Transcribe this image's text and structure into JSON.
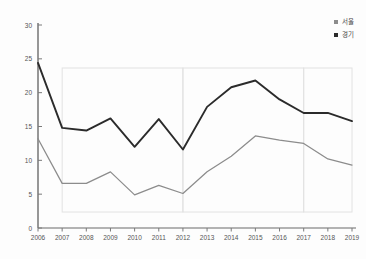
{
  "title_remnant": "",
  "legend": {
    "position": "top-right",
    "entries": [
      {
        "label": "서울",
        "color": "#8c8c8c",
        "marker": "square-marker"
      },
      {
        "label": "경기",
        "color": "#2b2b2b",
        "marker": "square-marker"
      }
    ]
  },
  "axis": {
    "y_ticks": [
      "0",
      "5",
      "10",
      "15",
      "20",
      "25",
      "30"
    ],
    "x_ticks": [
      "2006",
      "2007",
      "2008",
      "2009",
      "2010",
      "2011",
      "2012",
      "2013",
      "2014",
      "2015",
      "2016",
      "2017",
      "2018",
      "2019"
    ]
  },
  "chart_data": {
    "type": "line",
    "title": "",
    "xlabel": "",
    "ylabel": "",
    "x": [
      2006,
      2007,
      2008,
      2009,
      2010,
      2011,
      2012,
      2013,
      2014,
      2015,
      2016,
      2017,
      2018,
      2019
    ],
    "categories": [
      "2006",
      "2007",
      "2008",
      "2009",
      "2010",
      "2011",
      "2012",
      "2013",
      "2014",
      "2015",
      "2016",
      "2017",
      "2018",
      "2019"
    ],
    "series": [
      {
        "name": "서울",
        "color": "#2b2b2b",
        "values": [
          24.4,
          14.8,
          14.4,
          16.2,
          12.0,
          16.1,
          11.6,
          17.9,
          20.8,
          21.8,
          19.0,
          17.0,
          17.0,
          15.8
        ]
      },
      {
        "name": "경기",
        "color": "#8c8c8c",
        "values": [
          13.2,
          6.6,
          6.6,
          8.3,
          4.9,
          6.3,
          5.1,
          8.3,
          10.6,
          13.6,
          13.0,
          12.5,
          10.2,
          9.3
        ]
      }
    ],
    "ylim": [
      0,
      30
    ],
    "xlim": [
      2006,
      2019
    ],
    "grid": false,
    "highlight_bands": [
      {
        "from": "2007",
        "to": "2012"
      },
      {
        "from": "2012",
        "to": "2017"
      },
      {
        "from": "2017",
        "to": "2019"
      }
    ]
  }
}
